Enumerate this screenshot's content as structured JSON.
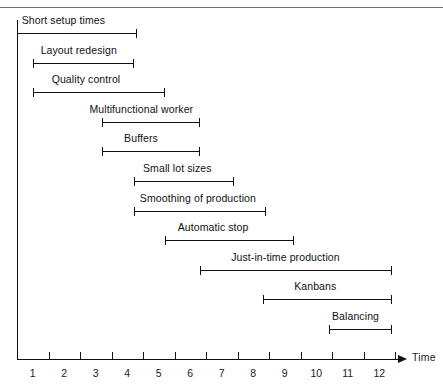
{
  "chart_data": {
    "type": "bar",
    "chart_subtype": "gantt",
    "title": "",
    "xlabel": "Time",
    "ylabel": "",
    "xlim": [
      0,
      12.2
    ],
    "xticks": [
      0,
      1,
      2,
      3,
      4,
      5,
      6,
      7,
      8,
      9,
      10,
      11,
      12
    ],
    "xtick_labels": [
      "1",
      "2",
      "3",
      "4",
      "5",
      "6",
      "7",
      "8",
      "9",
      "10",
      "11",
      "12"
    ],
    "xtick_label_placement": "between-ticks",
    "grid": false,
    "legend": null,
    "categories": [
      "Short setup times",
      "Layout redesign",
      "Quality control",
      "Multifunctional worker",
      "Buffers",
      "Small lot sizes",
      "Smoothing of production",
      "Automatic stop",
      "Just-in-time production",
      "Kanbans",
      "Balancing"
    ],
    "tasks": [
      {
        "label": "Short setup times",
        "start": 0.0,
        "end": 3.8,
        "label_x": 0.15,
        "row": 0
      },
      {
        "label": "Layout redesign",
        "start": 0.5,
        "end": 3.7,
        "label_x": 0.75,
        "row": 1
      },
      {
        "label": "Quality control",
        "start": 0.5,
        "end": 4.7,
        "label_x": 1.1,
        "row": 2
      },
      {
        "label": "Multifunctional worker",
        "start": 2.7,
        "end": 5.8,
        "label_x": 2.3,
        "row": 3
      },
      {
        "label": "Buffers",
        "start": 2.7,
        "end": 5.8,
        "label_x": 3.4,
        "row": 4
      },
      {
        "label": "Small lot sizes",
        "start": 3.7,
        "end": 6.9,
        "label_x": 4.0,
        "row": 5
      },
      {
        "label": "Smoothing of production",
        "start": 3.7,
        "end": 7.9,
        "label_x": 3.9,
        "row": 6
      },
      {
        "label": "Automatic stop",
        "start": 4.7,
        "end": 8.8,
        "label_x": 5.1,
        "row": 7
      },
      {
        "label": "Just-in-time production",
        "start": 5.8,
        "end": 11.9,
        "label_x": 6.8,
        "row": 8
      },
      {
        "label": "Kanbans",
        "start": 7.8,
        "end": 11.9,
        "label_x": 8.8,
        "row": 9
      },
      {
        "label": "Balancing",
        "start": 9.9,
        "end": 11.9,
        "label_x": 10.0,
        "row": 10
      }
    ],
    "colors": {
      "bar": "#111111",
      "axis": "#111111",
      "text": "#1a1a1a",
      "background": "#ffffff",
      "page_rule": "#6e6e6e"
    }
  }
}
